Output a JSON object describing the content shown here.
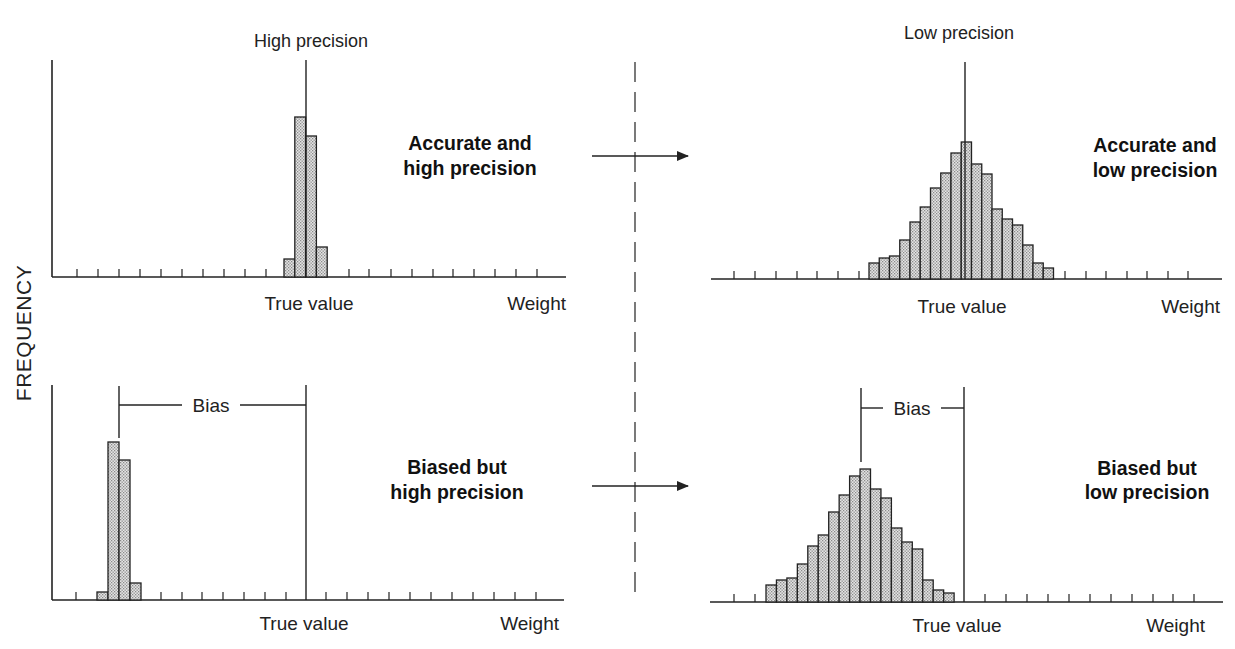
{
  "figure": {
    "y_axis_label": "FREQUENCY",
    "columns": [
      {
        "title": "High precision"
      },
      {
        "title": "Low precision"
      }
    ],
    "arrows": [
      {
        "from": "panel-top-left",
        "to": "panel-top-right"
      },
      {
        "from": "panel-bottom-left",
        "to": "panel-bottom-right"
      }
    ]
  },
  "chart_data": [
    {
      "id": "panel-top-left",
      "type": "bar",
      "title": "High precision",
      "annotation": [
        "Accurate and",
        "high precision"
      ],
      "xlabel": "Weight",
      "true_value_label": "True value",
      "ylabel": "FREQUENCY",
      "bias_label": null,
      "bins_relative_to_true_value": [
        -2,
        -1,
        0,
        1
      ],
      "values": [
        18,
        160,
        141,
        30
      ],
      "value_units": "relative frequency (px height)",
      "geometry": {
        "axis_x0": 52,
        "axis_x1": 566,
        "baseline_y": 277,
        "yaxis_top": 60,
        "has_y_axis": true,
        "bar_x0": 284,
        "bar_w": 10.8,
        "true_value_x": 306,
        "true_line_top": 60,
        "ticks": [
          77,
          98,
          119,
          140,
          161,
          182,
          203,
          224,
          245,
          266,
          349,
          369,
          391,
          412,
          433,
          453,
          474,
          495,
          516,
          537
        ],
        "title_x": 311,
        "title_y": 47,
        "annotation_x": 470,
        "annotation_y": [
          150,
          175
        ],
        "true_value_text_x": 309,
        "true_value_text_y": 310,
        "weight_text_x": 566,
        "weight_text_y": 310
      }
    },
    {
      "id": "panel-top-right",
      "type": "bar",
      "title": "Low precision",
      "annotation": [
        "Accurate and",
        "low precision"
      ],
      "xlabel": "Weight",
      "true_value_label": "True value",
      "bias_label": null,
      "bins_relative_to_true_value": [
        -9,
        -8,
        -7,
        -6,
        -5,
        -4,
        -3,
        -2,
        -1,
        0,
        1,
        2,
        3,
        4,
        5,
        6,
        7,
        8
      ],
      "values": [
        16,
        21,
        23,
        39,
        57,
        72,
        91,
        106,
        126,
        137,
        115,
        105,
        70,
        60,
        54,
        34,
        16,
        11
      ],
      "value_units": "relative frequency (px height)",
      "geometry": {
        "axis_x0": 711,
        "axis_x1": 1222,
        "baseline_y": 279,
        "yaxis_top": null,
        "has_y_axis": false,
        "bar_x0": 869,
        "bar_w": 10.25,
        "true_value_x": 965,
        "true_line_top": 62,
        "ticks": [
          734,
          755,
          776,
          797,
          817,
          838,
          859,
          1065,
          1086,
          1106,
          1127,
          1147,
          1168,
          1188
        ],
        "title_x": 959,
        "title_y": 39,
        "annotation_x": 1155,
        "annotation_y": [
          152,
          177
        ],
        "true_value_text_x": 962,
        "true_value_text_y": 313,
        "weight_text_x": 1220,
        "weight_text_y": 313
      }
    },
    {
      "id": "panel-bottom-left",
      "type": "bar",
      "title": "",
      "annotation": [
        "Biased but",
        "high precision"
      ],
      "xlabel": "Weight",
      "true_value_label": "True value",
      "bias_label": "Bias",
      "bins_relative_to_true_value": [
        -20,
        -19,
        -18,
        -17
      ],
      "values": [
        8,
        158,
        140,
        17
      ],
      "value_units": "relative frequency (px height)",
      "geometry": {
        "axis_x0": 52,
        "axis_x1": 564,
        "baseline_y": 600,
        "yaxis_top": 385,
        "has_y_axis": true,
        "bar_x0": 97,
        "bar_w": 11,
        "true_value_x": 306,
        "true_line_top": 385,
        "ticks": [
          76,
          161,
          182,
          202,
          223,
          244,
          265,
          286,
          326,
          347,
          368,
          389,
          410,
          431,
          452,
          473,
          494,
          515,
          536
        ],
        "bias_left_x": 119,
        "bias_left_top": 386,
        "bias_left_bottom": 438,
        "bias_line_y": 405,
        "bias_text_x": 211,
        "annotation_x": 457,
        "annotation_y": [
          474,
          499
        ],
        "true_value_text_x": 304,
        "true_value_text_y": 630,
        "weight_text_x": 559,
        "weight_text_y": 630
      }
    },
    {
      "id": "panel-bottom-right",
      "type": "bar",
      "title": "",
      "annotation": [
        "Biased but",
        "low precision"
      ],
      "xlabel": "Weight",
      "true_value_label": "True value",
      "bias_label": "Bias",
      "bins_relative_to_true_value": [
        -19,
        -18,
        -17,
        -16,
        -15,
        -14,
        -13,
        -12,
        -11,
        -10,
        -9,
        -8,
        -7,
        -6,
        -5,
        -4,
        -3,
        -2
      ],
      "values": [
        17,
        22,
        24,
        38,
        56,
        67,
        90,
        107,
        126,
        133,
        113,
        104,
        74,
        60,
        53,
        22,
        12,
        9
      ],
      "value_units": "relative frequency (px height)",
      "geometry": {
        "axis_x0": 710,
        "axis_x1": 1223,
        "baseline_y": 602,
        "yaxis_top": null,
        "has_y_axis": false,
        "bar_x0": 766,
        "bar_w": 10.45,
        "true_value_x": 964,
        "true_line_top": 387,
        "ticks": [
          734,
          755,
          985,
          1006,
          1027,
          1048,
          1069,
          1090,
          1111,
          1132,
          1153,
          1173,
          1194
        ],
        "bias_left_x": 861,
        "bias_left_top": 388,
        "bias_left_bottom": 462,
        "bias_line_y": 408,
        "bias_text_x": 912,
        "annotation_x": 1147,
        "annotation_y": [
          475,
          499
        ],
        "true_value_text_x": 957,
        "true_value_text_y": 632,
        "weight_text_x": 1205,
        "weight_text_y": 632
      }
    }
  ],
  "layout": {
    "divider_x": 635,
    "divider_y0": 62,
    "divider_y1": 602,
    "arrow_y": [
      156,
      486
    ],
    "arrow_x0": 592,
    "arrow_x1": 688,
    "freq_label_x": 23,
    "freq_label_y": 333,
    "ink_color": "#222222",
    "bar_fill_color": "#d6d6d6"
  }
}
